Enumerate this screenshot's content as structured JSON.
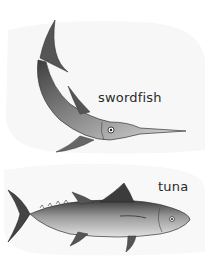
{
  "figure": {
    "background": "#ffffff",
    "fish": [
      {
        "id": "swordfish",
        "label": "swordfish"
      },
      {
        "id": "tuna",
        "label": "tuna"
      }
    ]
  },
  "colors": {
    "ink": "#2a2a2a",
    "body_dark": "#4a4a4a",
    "body_mid": "#8a8a8a",
    "body_light": "#d6d6d6"
  }
}
